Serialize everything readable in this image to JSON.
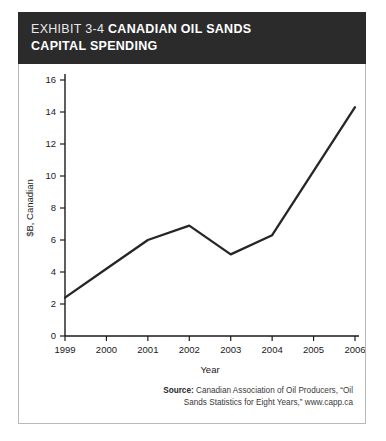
{
  "header": {
    "exhibit_number": "EXHIBIT 3-4",
    "title_line1": "CANADIAN OIL SANDS",
    "title_line2": "CAPITAL SPENDING"
  },
  "source": {
    "label": "Source:",
    "line1": "Canadian Association of Oil Producers, “Oil",
    "line2": "Sands Statistics for Eight Years,” www.capp.ca"
  },
  "colors": {
    "header_band": "#2b2b2b",
    "line": "#262626",
    "axis": "#1a1a1a",
    "panel_border": "#b9b9b9"
  },
  "chart_data": {
    "type": "line",
    "title": "Canadian Oil Sands Capital Spending",
    "xlabel": "Year",
    "ylabel": "$B, Canadian",
    "categories": [
      "1999",
      "2000",
      "2001",
      "2002",
      "2003",
      "2004",
      "2005",
      "2006"
    ],
    "values": [
      2.4,
      4.2,
      6.0,
      6.9,
      5.1,
      6.3,
      10.3,
      14.3
    ],
    "x": [
      1999,
      2000,
      2001,
      2002,
      2003,
      2004,
      2005,
      2006
    ],
    "ylim": [
      0,
      16
    ],
    "yticks": [
      0,
      2,
      4,
      6,
      8,
      10,
      12,
      14,
      16
    ],
    "ytick_labels": [
      "0",
      "2",
      "4",
      "6",
      "8",
      "10",
      "12",
      "14",
      "16"
    ],
    "grid": false,
    "legend": "none",
    "series": [
      {
        "name": "Capital Spending",
        "values": [
          2.4,
          4.2,
          6.0,
          6.9,
          5.1,
          6.3,
          10.3,
          14.3
        ]
      }
    ]
  }
}
